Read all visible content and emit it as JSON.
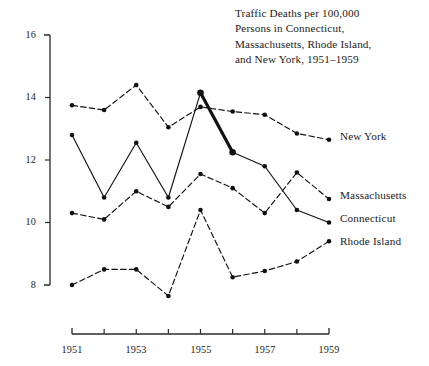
{
  "figure": {
    "title_lines": [
      "Traffic Deaths per 100,000",
      "Persons in Connecticut,",
      "Massachusetts, Rhode Island,",
      "and New York, 1951–1959"
    ]
  },
  "chart_data": {
    "type": "line",
    "title": "Traffic Deaths per 100,000 Persons in Connecticut, Massachusetts, Rhode Island, and New York, 1951–1959",
    "xlabel": "",
    "ylabel": "",
    "x": [
      1951,
      1952,
      1953,
      1954,
      1955,
      1956,
      1957,
      1958,
      1959
    ],
    "xtick_labels": [
      "1951",
      "",
      "1953",
      "",
      "1955",
      "",
      "1957",
      "",
      "1959"
    ],
    "xlim": [
      1951,
      1959
    ],
    "ytick_labels": [
      "8",
      "10",
      "12",
      "14",
      "16"
    ],
    "yticks": [
      8,
      10,
      12,
      14,
      16
    ],
    "ylim": [
      8,
      16
    ],
    "grid": false,
    "legend_position": "right-inline-labels",
    "series": [
      {
        "name": "New York",
        "label": "New York",
        "style": "dashed",
        "color": "#111111",
        "values": [
          13.75,
          13.6,
          14.4,
          13.05,
          13.7,
          13.55,
          13.45,
          12.85,
          12.65
        ]
      },
      {
        "name": "Massachusetts",
        "label": "Massachusetts",
        "style": "dashed",
        "color": "#111111",
        "values": [
          10.3,
          10.1,
          11.0,
          10.5,
          11.55,
          11.1,
          10.3,
          11.6,
          10.75
        ]
      },
      {
        "name": "Connecticut",
        "label": "Connecticut",
        "style": "solid",
        "color": "#111111",
        "values": [
          12.8,
          10.8,
          12.55,
          10.8,
          14.15,
          12.25,
          11.8,
          10.4,
          10.0
        ],
        "emphasis_segment": {
          "from_year": 1955,
          "to_year": 1956,
          "stroke_width": 3.2
        }
      },
      {
        "name": "Rhode Island",
        "label": "Rhode Island",
        "style": "dashed",
        "color": "#111111",
        "values": [
          8.0,
          8.5,
          8.5,
          7.65,
          10.4,
          8.25,
          8.45,
          8.75,
          9.4
        ]
      }
    ],
    "annotations": [
      {
        "text": "New York",
        "x": 1959,
        "y": 12.65,
        "position": "right"
      },
      {
        "text": "Massachusetts",
        "x": 1959,
        "y": 10.75,
        "position": "right"
      },
      {
        "text": "Connecticut",
        "x": 1959,
        "y": 10.0,
        "position": "right"
      },
      {
        "text": "Rhode Island",
        "x": 1959,
        "y": 9.4,
        "position": "right"
      }
    ]
  },
  "axes": {
    "y_ticks": [
      {
        "label": "16",
        "value": 16
      },
      {
        "label": "14",
        "value": 14
      },
      {
        "label": "12",
        "value": 12
      },
      {
        "label": "10",
        "value": 10
      },
      {
        "label": "8",
        "value": 8
      }
    ],
    "x_ticks": [
      {
        "label": "1951",
        "value": 1951
      },
      {
        "label": "",
        "value": 1952
      },
      {
        "label": "1953",
        "value": 1953
      },
      {
        "label": "",
        "value": 1954
      },
      {
        "label": "1955",
        "value": 1955
      },
      {
        "label": "",
        "value": 1956
      },
      {
        "label": "1957",
        "value": 1957
      },
      {
        "label": "",
        "value": 1958
      },
      {
        "label": "1959",
        "value": 1959
      }
    ]
  },
  "labels": {
    "new_york": "New York",
    "massachusetts": "Massachusetts",
    "connecticut": "Connecticut",
    "rhode_island": "Rhode Island"
  },
  "ytick_text": {
    "t16": "16",
    "t14": "14",
    "t12": "12",
    "t10": "10",
    "t8": "8"
  },
  "xtick_text": {
    "y1951": "1951",
    "y1953": "1953",
    "y1955": "1955",
    "y1957": "1957",
    "y1959": "1959"
  },
  "title": {
    "line1": "Traffic Deaths per 100,000",
    "line2": "Persons in Connecticut,",
    "line3": "Massachusetts, Rhode Island,",
    "line4": "and New York, 1951–1959"
  }
}
